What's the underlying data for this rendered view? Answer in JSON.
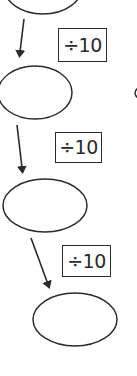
{
  "diagram": {
    "type": "flow-chain",
    "stroke_color": "#2a2a2a",
    "background": "#ffffff",
    "nodes": [
      {
        "id": "ellipse-1",
        "value": "",
        "note": "partially cut off at top"
      },
      {
        "id": "ellipse-2",
        "value": ""
      },
      {
        "id": "ellipse-3",
        "value": ""
      },
      {
        "id": "ellipse-4",
        "value": ""
      }
    ],
    "operations": [
      {
        "label": "÷10"
      },
      {
        "label": "÷10"
      },
      {
        "label": "÷10"
      }
    ],
    "partial_shape_right": "edge of another ellipse at right margin"
  }
}
